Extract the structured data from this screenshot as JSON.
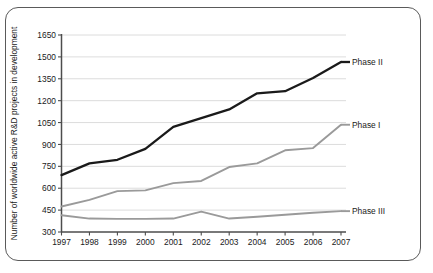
{
  "chart_data": {
    "type": "line",
    "title": "",
    "xlabel": "",
    "ylabel": "Number of worldwide active R&D projects in development",
    "x": [
      1997,
      1998,
      1999,
      2000,
      2001,
      2002,
      2003,
      2004,
      2005,
      2006,
      2007
    ],
    "categories": [
      "1997",
      "1998",
      "1999",
      "2000",
      "2001",
      "2002",
      "2003",
      "2004",
      "2005",
      "2006",
      "2007"
    ],
    "xlim": [
      1997,
      2007
    ],
    "ylim": [
      300,
      1650
    ],
    "yticks": [
      300,
      450,
      600,
      750,
      900,
      1050,
      1200,
      1350,
      1500,
      1650
    ],
    "ytick_labels": [
      "300",
      "450",
      "600",
      "750",
      "900",
      "1050",
      "1200",
      "1350",
      "1500",
      "1650"
    ],
    "grid": "horizontal",
    "legend_position": "inline-right",
    "series": [
      {
        "name": "Phase II",
        "label": "Phase II",
        "color": "#1a1a1a",
        "width": 2.3,
        "values": [
          690,
          770,
          795,
          870,
          1020,
          1080,
          1140,
          1250,
          1265,
          1355,
          1465
        ]
      },
      {
        "name": "Phase I",
        "label": "Phase I",
        "color": "#9a9a9a",
        "width": 1.9,
        "values": [
          475,
          520,
          580,
          585,
          635,
          650,
          745,
          770,
          860,
          875,
          1035
        ]
      },
      {
        "name": "Phase III",
        "label": "Phase III",
        "color": "#9a9a9a",
        "width": 1.9,
        "values": [
          415,
          392,
          390,
          390,
          392,
          440,
          392,
          405,
          418,
          432,
          443
        ]
      }
    ]
  },
  "frame": {
    "border_color": "#5a5a5a",
    "background": "#ffffff"
  }
}
